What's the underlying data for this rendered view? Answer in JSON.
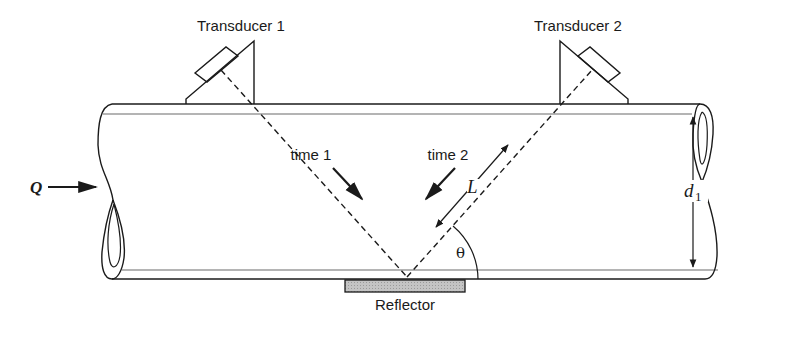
{
  "diagram": {
    "labels": {
      "transducer1": "Transducer 1",
      "transducer2": "Transducer 2",
      "time1": "time 1",
      "time2": "time 2",
      "reflector": "Reflector",
      "flow": "Q",
      "path_length": "L",
      "angle": "θ",
      "diameter": "d",
      "diameter_subscript": "1"
    },
    "colors": {
      "line": "#1a1a1a",
      "pipe_inner": "#6a6a6a",
      "reflector_fill": "#bdbdbd",
      "background": "#ffffff"
    }
  }
}
